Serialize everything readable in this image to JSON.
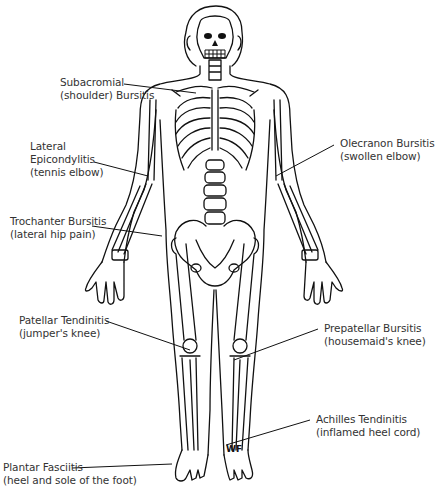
{
  "diagram": {
    "type": "anatomical skeleton with labeled conditions",
    "signature": "WF",
    "labels": [
      {
        "id": "subacromial",
        "line1": "Subacromial",
        "line2": "(shoulder) Bursitis"
      },
      {
        "id": "lateral-epicondylitis",
        "line1": "Lateral",
        "line2": "Epicondylitis",
        "line3": "(tennis elbow)"
      },
      {
        "id": "trochanter",
        "line1": "Trochanter Bursitis",
        "line2": "(lateral hip pain)"
      },
      {
        "id": "olecranon",
        "line1": "Olecranon Bursitis",
        "line2": "(swollen elbow)"
      },
      {
        "id": "patellar",
        "line1": "Patellar Tendinitis",
        "line2": "(jumper's knee)"
      },
      {
        "id": "prepatellar",
        "line1": "Prepatellar Bursitis",
        "line2": "(housemaid's knee)"
      },
      {
        "id": "achilles",
        "line1": "Achilles Tendinitis",
        "line2": "(inflamed heel cord)"
      },
      {
        "id": "plantar",
        "line1": "Plantar Fasciitis",
        "line2": "(heel and sole of the foot)"
      }
    ]
  }
}
